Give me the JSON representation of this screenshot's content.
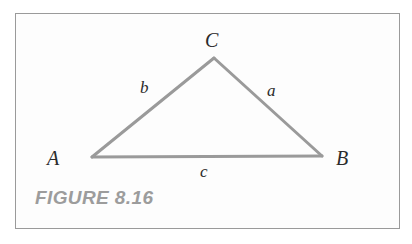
{
  "figure": {
    "caption": "FIGURE 8.16",
    "frame": {
      "border_color": "#9a9a9a",
      "background_color": "#fdfdfd"
    },
    "caption_color": "#9c9c9c"
  },
  "diagram": {
    "type": "triangle",
    "stroke_color": "#9a9a9a",
    "stroke_width": 3,
    "label_color": "#2b2b2b",
    "vertices": [
      {
        "name": "C",
        "label": "C",
        "x": 214,
        "y": 58
      },
      {
        "name": "A",
        "label": "A",
        "x": 92,
        "y": 157
      },
      {
        "name": "B",
        "label": "B",
        "x": 322,
        "y": 156
      }
    ],
    "sides": [
      {
        "name": "side-a",
        "label": "a",
        "from": "C",
        "to": "B"
      },
      {
        "name": "side-b",
        "label": "b",
        "from": "A",
        "to": "C"
      },
      {
        "name": "side-c",
        "label": "c",
        "from": "A",
        "to": "B"
      }
    ],
    "vertex_labels": {
      "a": "A",
      "b": "B",
      "c": "C"
    },
    "side_labels": {
      "a": "a",
      "b": "b",
      "c": "c"
    }
  }
}
